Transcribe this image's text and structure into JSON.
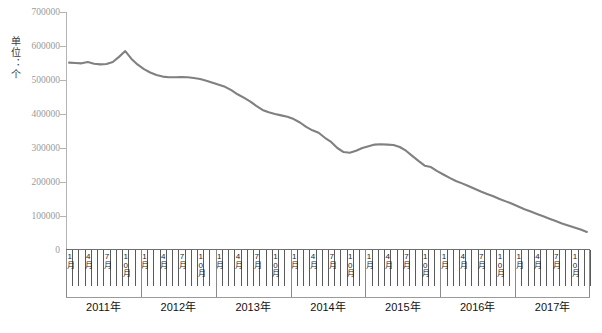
{
  "chart_data": {
    "type": "line",
    "title": "",
    "xlabel": "",
    "ylabel": "单位：个",
    "ylim": [
      0,
      700000
    ],
    "ytick_values": [
      0,
      100000,
      200000,
      300000,
      400000,
      500000,
      600000,
      700000
    ],
    "ytick_labels": [
      "0",
      "100000",
      "200000",
      "300000",
      "400000",
      "500000",
      "600000",
      "700000"
    ],
    "grid": false,
    "legend": null,
    "line_color": "#808080",
    "years": [
      "2011年",
      "2012年",
      "2013年",
      "2014年",
      "2015年",
      "2016年",
      "2017年"
    ],
    "month_tick_labels": [
      "1月",
      "4月",
      "7月",
      "10月"
    ],
    "months_per_year": 12,
    "x": [
      "2011-01",
      "2011-02",
      "2011-03",
      "2011-04",
      "2011-05",
      "2011-06",
      "2011-07",
      "2011-08",
      "2011-09",
      "2011-10",
      "2011-11",
      "2011-12",
      "2012-01",
      "2012-02",
      "2012-03",
      "2012-04",
      "2012-05",
      "2012-06",
      "2012-07",
      "2012-08",
      "2012-09",
      "2012-10",
      "2012-11",
      "2012-12",
      "2013-01",
      "2013-02",
      "2013-03",
      "2013-04",
      "2013-05",
      "2013-06",
      "2013-07",
      "2013-08",
      "2013-09",
      "2013-10",
      "2013-11",
      "2013-12",
      "2014-01",
      "2014-02",
      "2014-03",
      "2014-04",
      "2014-05",
      "2014-06",
      "2014-07",
      "2014-08",
      "2014-09",
      "2014-10",
      "2014-11",
      "2014-12",
      "2015-01",
      "2015-02",
      "2015-03",
      "2015-04",
      "2015-05",
      "2015-06",
      "2015-07",
      "2015-08",
      "2015-09",
      "2015-10",
      "2015-11",
      "2015-12",
      "2016-01",
      "2016-02",
      "2016-03",
      "2016-04",
      "2016-05",
      "2016-06",
      "2016-07",
      "2016-08",
      "2016-09",
      "2016-10",
      "2016-11",
      "2016-12",
      "2017-01",
      "2017-02",
      "2017-03",
      "2017-04",
      "2017-05",
      "2017-06",
      "2017-07",
      "2017-08",
      "2017-09",
      "2017-10",
      "2017-11",
      "2017-12"
    ],
    "values": [
      551000,
      550000,
      549000,
      553000,
      548000,
      546000,
      547000,
      553000,
      568000,
      585000,
      562000,
      545000,
      532000,
      522000,
      515000,
      510000,
      508000,
      508000,
      509000,
      508000,
      506000,
      503000,
      498000,
      492000,
      486000,
      480000,
      470000,
      458000,
      448000,
      437000,
      424000,
      412000,
      405000,
      400000,
      396000,
      392000,
      385000,
      375000,
      362000,
      352000,
      345000,
      330000,
      318000,
      300000,
      288000,
      286000,
      292000,
      300000,
      305000,
      310000,
      311000,
      310000,
      309000,
      303000,
      292000,
      277000,
      262000,
      248000,
      244000,
      232000,
      222000,
      212000,
      203000,
      196000,
      188000,
      180000,
      172000,
      165000,
      158000,
      150000,
      143000,
      136000,
      128000,
      120000,
      113000,
      106000,
      99000,
      92000,
      85000,
      78000,
      72000,
      66000,
      60000,
      53000
    ]
  },
  "axis": {
    "unit_text": "单位：个"
  }
}
